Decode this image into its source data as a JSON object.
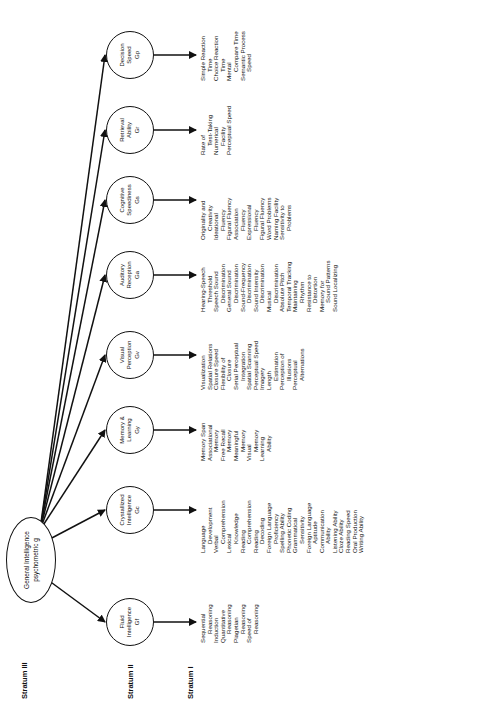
{
  "strata": {
    "iii": "Stratum III",
    "ii": "Stratum II",
    "i": "Stratum I"
  },
  "general": {
    "line1": "General Intelligence",
    "line2": "psychometric g"
  },
  "factors": [
    {
      "name": "Fluid",
      "l1": "Fluid",
      "l2": "Intelligence",
      "code": "Gf",
      "abilities": [
        [
          "Sequential",
          "Reasoning"
        ],
        [
          "Induction"
        ],
        [
          "Quantitative",
          "Reasoning"
        ],
        [
          "Piagetian",
          "Reasoning"
        ],
        [
          "Speed of",
          "Reasoning"
        ]
      ]
    },
    {
      "name": "Crystallized",
      "l1": "Crystallized",
      "l2": "Intelligence",
      "code": "Gc",
      "abilities": [
        [
          "Language",
          "Development"
        ],
        [
          "Verbal",
          "Comprehension"
        ],
        [
          "Lexical",
          "Knowledge"
        ],
        [
          "Reading",
          "Comprehension"
        ],
        [
          "Reading",
          "Decoding"
        ],
        [
          "Foreign Language",
          "Proficiency"
        ],
        [
          "Spelling Ability"
        ],
        [
          "Phonetic Coding"
        ],
        [
          "Grammatical",
          "Sensitivity"
        ],
        [
          "Foreign Language",
          "Aptitude"
        ],
        [
          "Communication",
          "Ability"
        ],
        [
          "Listening Ability"
        ],
        [
          "Cloze Ability"
        ],
        [
          "Reading Speed"
        ],
        [
          "Oral Production"
        ],
        [
          "Writing Ability"
        ]
      ]
    },
    {
      "name": "Memory",
      "l1": "Memory &",
      "l2": "Learning",
      "code": "Gy",
      "abilities": [
        [
          "Memory Span"
        ],
        [
          "Associational",
          "Memory"
        ],
        [
          "Free Recall",
          "Memory"
        ],
        [
          "Meaningful",
          "Memory"
        ],
        [
          "Visual",
          "Memory"
        ],
        [
          "Learning",
          "Ability"
        ]
      ]
    },
    {
      "name": "Visual",
      "l1": "Visual",
      "l2": "Perception",
      "code": "Gv",
      "abilities": [
        [
          "Visualization"
        ],
        [
          "Spatial Relations"
        ],
        [
          "Closure Speed"
        ],
        [
          "Flexibility of",
          "Closure"
        ],
        [
          "Serial Perceptual",
          "Integration"
        ],
        [
          "Spatial Scanning"
        ],
        [
          "Perceptual Speed"
        ],
        [
          "Imagery"
        ],
        [
          "Length",
          "Estimation"
        ],
        [
          "Perception of",
          "Illusions"
        ],
        [
          "Perceptual",
          "Alternations"
        ]
      ]
    },
    {
      "name": "Auditory",
      "l1": "Auditory",
      "l2": "Reception",
      "code": "Ga",
      "abilities": [
        [
          "Hearing-Speech",
          "Threshold"
        ],
        [
          "Speech Sound",
          "Discrimination"
        ],
        [
          "General Sound",
          "Discrimination"
        ],
        [
          "Sound-Frequency",
          "Discrimination"
        ],
        [
          "Sound Intensity",
          "Discrimination"
        ],
        [
          "Musical",
          "Discrimination"
        ],
        [
          "Absolute Pitch"
        ],
        [
          "Temporal Tracking"
        ],
        [
          "Maintaining",
          "Rhythm"
        ],
        [
          "Resistance to",
          "Distortion"
        ],
        [
          "Memory for",
          "Sound Patterns"
        ],
        [
          "Sound Localizing"
        ]
      ]
    },
    {
      "name": "Cognitive",
      "l1": "Cognitive",
      "l2": "Speediness",
      "code": "Gs",
      "abilities": [
        [
          "Originality and",
          "Creativity"
        ],
        [
          "Ideational",
          "Fluency"
        ],
        [
          "Figural Fluency"
        ],
        [
          "Association",
          "Fluency"
        ],
        [
          "Expressional",
          "Fluency"
        ],
        [
          "Figural Fluency"
        ],
        [
          "Word Problems"
        ],
        [
          "Naming Facility"
        ],
        [
          "Sensitivity to",
          "Problems"
        ]
      ]
    },
    {
      "name": "Retrieval",
      "l1": "Retrieval",
      "l2": "Ability",
      "code": "Gr",
      "abilities": [
        [
          "Rate of",
          "Test-Taking"
        ],
        [
          "Numerical",
          "Facility"
        ],
        [
          "Perceptual Speed"
        ]
      ]
    },
    {
      "name": "Decision",
      "l1": "Decision",
      "l2": "Speed",
      "code": "Gp",
      "abilities": [
        [
          "Simple Reaction",
          "Time"
        ],
        [
          "Choice Reaction",
          "Time"
        ],
        [
          "Mental",
          "Compare Time"
        ],
        [
          "Semantic Process",
          "Speed"
        ]
      ]
    }
  ]
}
